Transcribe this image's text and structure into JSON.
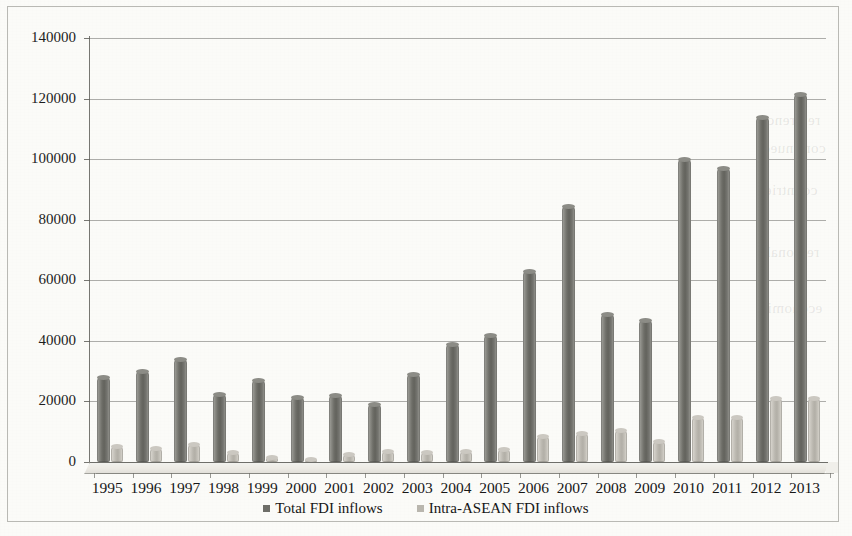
{
  "chart_data": {
    "type": "bar",
    "title": "",
    "subtitle": "",
    "xlabel": "",
    "ylabel": "",
    "grid": true,
    "legend_position": "bottom",
    "ylim": [
      0,
      140000
    ],
    "yticks": [
      0,
      20000,
      40000,
      60000,
      80000,
      100000,
      120000,
      140000
    ],
    "ytick_labels": [
      "0",
      "20000",
      "40000",
      "60000",
      "80000",
      "100000",
      "120000",
      "140000"
    ],
    "categories": [
      "1995",
      "1996",
      "1997",
      "1998",
      "1999",
      "2000",
      "2001",
      "2002",
      "2003",
      "2004",
      "2005",
      "2006",
      "2007",
      "2008",
      "2009",
      "2010",
      "2011",
      "2012",
      "2013"
    ],
    "series": [
      {
        "name": "Total FDI inflows",
        "color": "#6e6e68",
        "values": [
          28000,
          30000,
          34000,
          22500,
          27000,
          21500,
          22000,
          19000,
          29000,
          39000,
          42000,
          63000,
          84500,
          49000,
          47000,
          100000,
          97000,
          114000,
          121500
        ]
      },
      {
        "name": "Intra-ASEAN FDI inflows",
        "color": "#b9b6ae",
        "values": [
          5200,
          4700,
          5800,
          3300,
          1800,
          900,
          2700,
          3800,
          3300,
          3500,
          4200,
          8600,
          9700,
          10500,
          6800,
          15000,
          14800,
          21000,
          21000
        ]
      }
    ]
  },
  "legend": {
    "items": [
      {
        "label": "Total FDI inflows",
        "swatch": "total"
      },
      {
        "label": "Intra-ASEAN FDI inflows",
        "swatch": "intra"
      }
    ]
  },
  "bleed_text": {
    "line1": "reference",
    "line2": "continued",
    "line3": "countries",
    "line4": "regional",
    "line5": "economic"
  }
}
